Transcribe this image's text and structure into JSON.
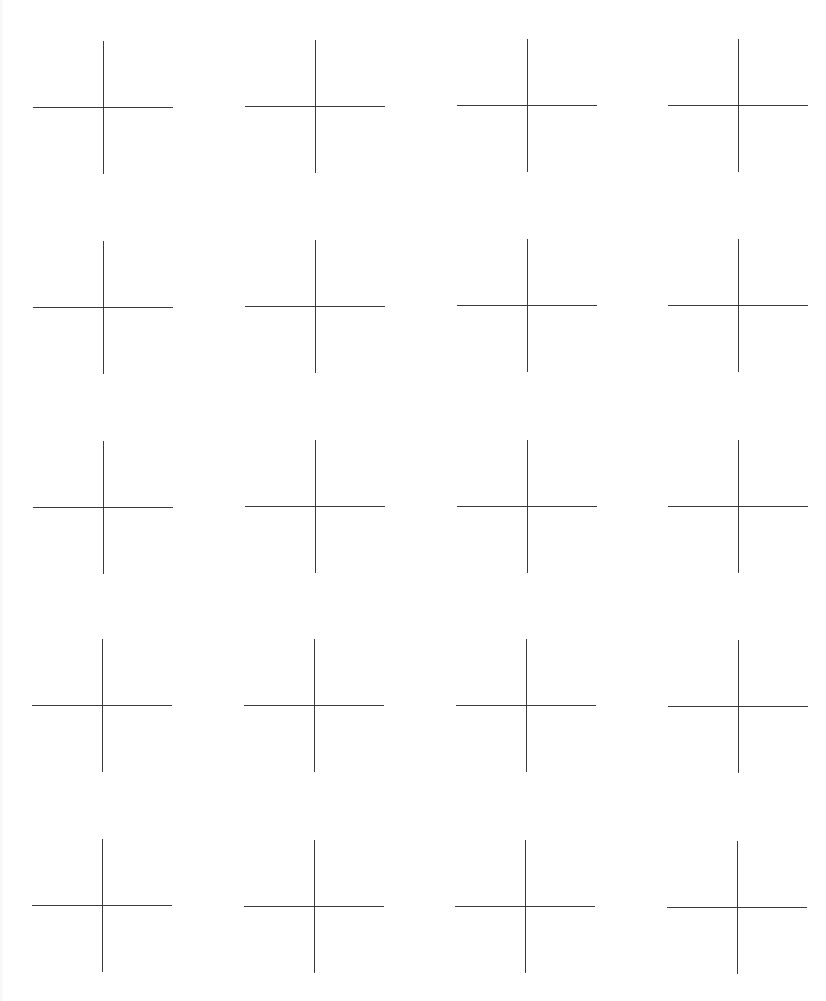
{
  "page": {
    "width": 826,
    "height": 1001,
    "background": "#ffffff",
    "line_color": "#3a3a3a",
    "line_width": 1
  },
  "grid": {
    "rows": 5,
    "columns": 4,
    "column_centers_x": [
      102,
      315,
      527,
      738
    ],
    "row_centers_y": [
      106,
      306,
      506,
      705,
      906
    ],
    "cross_width": 140,
    "cross_height": 133
  },
  "crosses": [
    {
      "row": 1,
      "col": 1,
      "cx": 103,
      "cy": 107
    },
    {
      "row": 1,
      "col": 2,
      "cx": 315,
      "cy": 106
    },
    {
      "row": 1,
      "col": 3,
      "cx": 527,
      "cy": 105
    },
    {
      "row": 1,
      "col": 4,
      "cx": 738,
      "cy": 105
    },
    {
      "row": 2,
      "col": 1,
      "cx": 103,
      "cy": 307
    },
    {
      "row": 2,
      "col": 2,
      "cx": 315,
      "cy": 306
    },
    {
      "row": 2,
      "col": 3,
      "cx": 527,
      "cy": 305
    },
    {
      "row": 2,
      "col": 4,
      "cx": 738,
      "cy": 305
    },
    {
      "row": 3,
      "col": 1,
      "cx": 103,
      "cy": 507
    },
    {
      "row": 3,
      "col": 2,
      "cx": 315,
      "cy": 506
    },
    {
      "row": 3,
      "col": 3,
      "cx": 527,
      "cy": 506
    },
    {
      "row": 3,
      "col": 4,
      "cx": 738,
      "cy": 506
    },
    {
      "row": 4,
      "col": 1,
      "cx": 102,
      "cy": 705
    },
    {
      "row": 4,
      "col": 2,
      "cx": 314,
      "cy": 705
    },
    {
      "row": 4,
      "col": 3,
      "cx": 526,
      "cy": 705
    },
    {
      "row": 4,
      "col": 4,
      "cx": 738,
      "cy": 706
    },
    {
      "row": 5,
      "col": 1,
      "cx": 102,
      "cy": 905
    },
    {
      "row": 5,
      "col": 2,
      "cx": 314,
      "cy": 906
    },
    {
      "row": 5,
      "col": 3,
      "cx": 525,
      "cy": 906
    },
    {
      "row": 5,
      "col": 4,
      "cx": 737,
      "cy": 907
    }
  ]
}
